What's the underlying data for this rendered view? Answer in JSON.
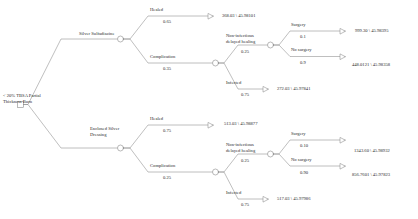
{
  "diagram": {
    "type": "decision-tree",
    "root": {
      "label": "< 20% TBSA Partial\nThickness Burn",
      "node_type": "decision-square"
    },
    "branches": [
      {
        "label": "Silver Sulfadiazine",
        "node_type": "chance-circle",
        "children": [
          {
            "label": "Healed",
            "prob": "0.65",
            "terminal": true,
            "payoff": "368.03 \\ 45.98101"
          },
          {
            "label": "Complication",
            "prob": "0.35",
            "node_type": "chance-circle",
            "children": [
              {
                "label": "Non-infectious\ndelayed healing",
                "prob": "0.25",
                "node_type": "chance-circle",
                "children": [
                  {
                    "label": "Surgery",
                    "prob": "0.1",
                    "terminal": true,
                    "payoff": "999.30 \\ 45.98395"
                  },
                  {
                    "label": "No surgery",
                    "prob": "0.9",
                    "terminal": true,
                    "payoff": "448.0121 \\ 45.98358"
                  }
                ]
              },
              {
                "label": "Infected",
                "prob": "0.75",
                "terminal": true,
                "payoff": "272.03 \\ 45.97841"
              }
            ]
          }
        ]
      },
      {
        "label": "Enclosed Silver\nDressing",
        "node_type": "chance-circle",
        "children": [
          {
            "label": "Healed",
            "prob": "0.75",
            "terminal": true,
            "payoff": "513.03 \\ 45.98877"
          },
          {
            "label": "Complication",
            "prob": "0.25",
            "node_type": "chance-circle",
            "children": [
              {
                "label": "Non-infectious\ndelayed healing",
                "prob": "0.25",
                "node_type": "chance-circle",
                "children": [
                  {
                    "label": "Surgery",
                    "prob": "0.10",
                    "terminal": true,
                    "payoff": "1343.60 \\ 45.98932"
                  },
                  {
                    "label": "No surgery",
                    "prob": "0.90",
                    "terminal": true,
                    "payoff": "856.7601 \\ 45.97823"
                  }
                ]
              },
              {
                "label": "Infected",
                "prob": "0.75",
                "terminal": true,
                "payoff": "517.03 \\ 45.97986"
              }
            ]
          }
        ]
      }
    ]
  },
  "style": {
    "line_color": "#8a8a8a",
    "text_color": "#2b2b2b",
    "background": "#ffffff"
  }
}
